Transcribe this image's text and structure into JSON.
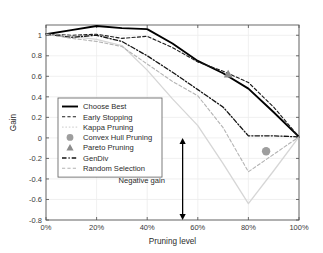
{
  "chart_data": {
    "type": "line",
    "title": "",
    "xlabel": "Pruning level",
    "ylabel": "Gain",
    "xlim": [
      0,
      100
    ],
    "ylim": [
      -0.8,
      1.1
    ],
    "grid": true,
    "legend_position": "center-left",
    "xtick_labels": [
      "0%",
      "20%",
      "40%",
      "60%",
      "80%",
      "100%"
    ],
    "xtick_values": [
      0,
      20,
      40,
      60,
      80,
      100
    ],
    "ytick_labels": [
      "1",
      "0.8",
      "0.6",
      "0.4",
      "0.2",
      "0",
      "-0.2",
      "-0.4",
      "-0.6",
      "-0.8"
    ],
    "ytick_values": [
      1,
      0.8,
      0.6,
      0.4,
      0.2,
      0,
      -0.2,
      -0.4,
      -0.6,
      -0.8
    ],
    "x": [
      0,
      10,
      20,
      30,
      40,
      50,
      60,
      70,
      80,
      90,
      100
    ],
    "series": [
      {
        "name": "Choose Best",
        "style": "solid",
        "color": "#000000",
        "width": 1.9,
        "values": [
          1.01,
          1.05,
          1.09,
          1.07,
          1.06,
          0.92,
          0.75,
          0.63,
          0.48,
          0.25,
          0.01
        ]
      },
      {
        "name": "Early Stopping",
        "style": "dashed",
        "color": "#1d1d1d",
        "width": 1.1,
        "values": [
          1.01,
          1.0,
          1.01,
          0.97,
          0.99,
          0.88,
          0.74,
          0.65,
          0.54,
          0.3,
          0.01
        ]
      },
      {
        "name": "Kappa Pruning",
        "style": "solid",
        "color": "#d6d6d6",
        "width": 1.3,
        "values": [
          1.01,
          0.99,
          0.96,
          0.9,
          0.66,
          0.38,
          0.12,
          -0.25,
          -0.64,
          -0.32,
          0.01
        ]
      },
      {
        "name": "GenDiv",
        "style": "dashdot",
        "color": "#141414",
        "width": 1.3,
        "values": [
          1.01,
          0.98,
          1.0,
          0.94,
          0.8,
          0.64,
          0.47,
          0.3,
          0.02,
          0.02,
          0.01
        ]
      },
      {
        "name": "Random Selection",
        "style": "dashed",
        "color": "#b4b4b4",
        "width": 1.1,
        "values": [
          1.01,
          0.97,
          0.94,
          0.89,
          0.72,
          0.55,
          0.41,
          0.1,
          -0.33,
          -0.16,
          0.01
        ]
      }
    ],
    "markers": [
      {
        "name": "Pareto Pruning",
        "shape": "triangle",
        "color": "#8c8c8c",
        "x": 72,
        "y": 0.62
      },
      {
        "name": "Convex Hull Pruning",
        "shape": "circle",
        "color": "#9e9e9e",
        "x": 87,
        "y": -0.13
      }
    ],
    "annotations": [
      {
        "name": "negative-gain",
        "text": "Negative gain",
        "arrow_x": 54,
        "arrow_y_top": 0.0,
        "arrow_y_bottom": -0.8,
        "text_x": 47,
        "text_y": -0.44
      }
    ],
    "legend_entries": [
      {
        "label": "Choose Best",
        "kind": "line",
        "style": "solid",
        "color": "#000000",
        "width": 1.9
      },
      {
        "label": "Early Stopping",
        "kind": "line",
        "style": "dashed",
        "color": "#1d1d1d",
        "width": 1.1
      },
      {
        "label": "Kappa Pruning",
        "kind": "line",
        "style": "dotted",
        "color": "#d6d6d6",
        "width": 1.2
      },
      {
        "label": "Convex Hull Pruning",
        "kind": "marker",
        "shape": "circle",
        "color": "#9e9e9e"
      },
      {
        "label": "Pareto Pruning",
        "kind": "marker",
        "shape": "triangle",
        "color": "#8c8c8c"
      },
      {
        "label": "GenDiv",
        "kind": "line",
        "style": "dashdot",
        "color": "#141414",
        "width": 1.3
      },
      {
        "label": "Random Selection",
        "kind": "line",
        "style": "dashed",
        "color": "#b4b4b4",
        "width": 1.1
      }
    ]
  },
  "colors": {
    "axis": "#5a5a5a",
    "grid": "#ececec",
    "background": "#ffffff",
    "text": "#2b2b2b",
    "annotation_arrow": "#000000"
  }
}
